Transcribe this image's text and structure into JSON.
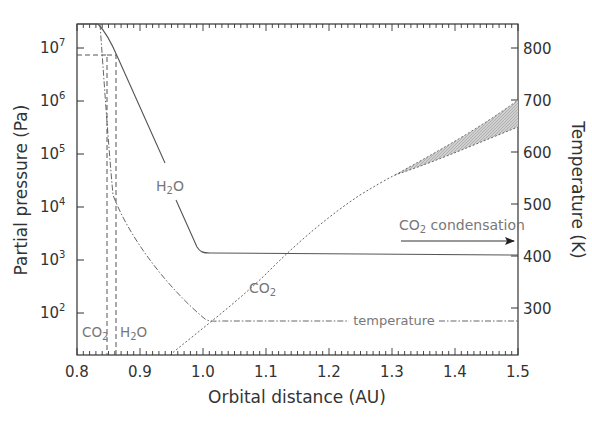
{
  "chart_data": {
    "type": "line",
    "title": "",
    "xlabel": "Orbital distance (AU)",
    "ylabel": "Partial pressure (Pa)",
    "y2label": "Temperature (K)",
    "xlim": [
      0.8,
      1.5
    ],
    "ylim": [
      10,
      30000000
    ],
    "yscale": "log",
    "y2lim": [
      200,
      840
    ],
    "x_ticks": [
      "0.8",
      "0.9",
      "1.0",
      "1.1",
      "1.2",
      "1.3",
      "1.4",
      "1.5"
    ],
    "y_ticks": [
      {
        "base": "10",
        "exp": "7"
      },
      {
        "base": "10",
        "exp": "6"
      },
      {
        "base": "10",
        "exp": "5"
      },
      {
        "base": "10",
        "exp": "4"
      },
      {
        "base": "10",
        "exp": "3"
      },
      {
        "base": "10",
        "exp": "2"
      }
    ],
    "y2_ticks": [
      "800",
      "700",
      "600",
      "500",
      "400",
      "300"
    ],
    "grid": false,
    "series": [
      {
        "name": "H2O",
        "style": "solid",
        "axis": "left",
        "x": [
          0.8,
          0.835,
          0.86,
          0.9,
          0.95,
          0.985,
          1.0,
          1.05,
          1.1,
          1.2,
          1.3,
          1.4,
          1.5
        ],
        "values": [
          25000000,
          25000000,
          5000000,
          300000,
          20000,
          2500,
          1300,
          1250,
          1200,
          1180,
          1170,
          1160,
          1150
        ]
      },
      {
        "name": "CO2",
        "style": "dotted",
        "axis": "left",
        "x": [
          0.95,
          1.0,
          1.05,
          1.1,
          1.15,
          1.2,
          1.25,
          1.3,
          1.35,
          1.4,
          1.45,
          1.5
        ],
        "values": [
          10,
          45,
          200,
          700,
          2000,
          4500,
          8000,
          13000,
          20000,
          35000,
          60000,
          100000
        ],
        "upper_bound_values": [
          10,
          45,
          200,
          700,
          2000,
          4500,
          8000,
          13000,
          22000,
          60000,
          150000,
          400000
        ],
        "shaded_region_x": [
          1.3,
          1.5
        ]
      },
      {
        "name": "temperature",
        "style": "dash-dot",
        "axis": "right",
        "x": [
          0.835,
          0.85,
          0.87,
          0.9,
          0.95,
          1.0,
          1.1,
          1.2,
          1.3,
          1.4,
          1.5
        ],
        "values": [
          840,
          740,
          520,
          420,
          330,
          275,
          275,
          275,
          275,
          275,
          275
        ]
      }
    ],
    "vertical_markers": [
      {
        "label": "CO2",
        "x": 0.85,
        "style": "dashed",
        "top_pressure": 7000000
      },
      {
        "label": "H2O",
        "x": 0.865,
        "style": "dashed",
        "top_pressure": 7000000
      }
    ],
    "annotations": [
      {
        "text": "H2O",
        "x": 0.93,
        "y": 15000
      },
      {
        "text": "CO2",
        "x": 1.07,
        "y": 450
      },
      {
        "text": "temperature",
        "x": 1.27,
        "y_temperature": 285
      },
      {
        "text": "CO2 condensation",
        "x": 1.36,
        "y": 2500,
        "arrow_to_x": 1.49
      }
    ]
  },
  "labels": {
    "xlabel": "Orbital distance (AU)",
    "ylabel": "Partial pressure (Pa)",
    "y2label": "Temperature (K)",
    "h2o_curve": {
      "main": "H",
      "sub": "2",
      "tail": "O"
    },
    "co2_curve": {
      "main": "CO",
      "sub": "2"
    },
    "co2_marker": {
      "main": "CO",
      "sub": "2"
    },
    "h2o_marker": {
      "main": "H",
      "sub": "2",
      "tail": "O"
    },
    "temperature": "temperature",
    "condensation": {
      "main": "CO",
      "sub": "2",
      "tail": " condensation"
    }
  },
  "colors": {
    "axis": "#333333",
    "curve": "#555555",
    "annotation_text": "#777777",
    "shading": "#bdbdbd"
  }
}
